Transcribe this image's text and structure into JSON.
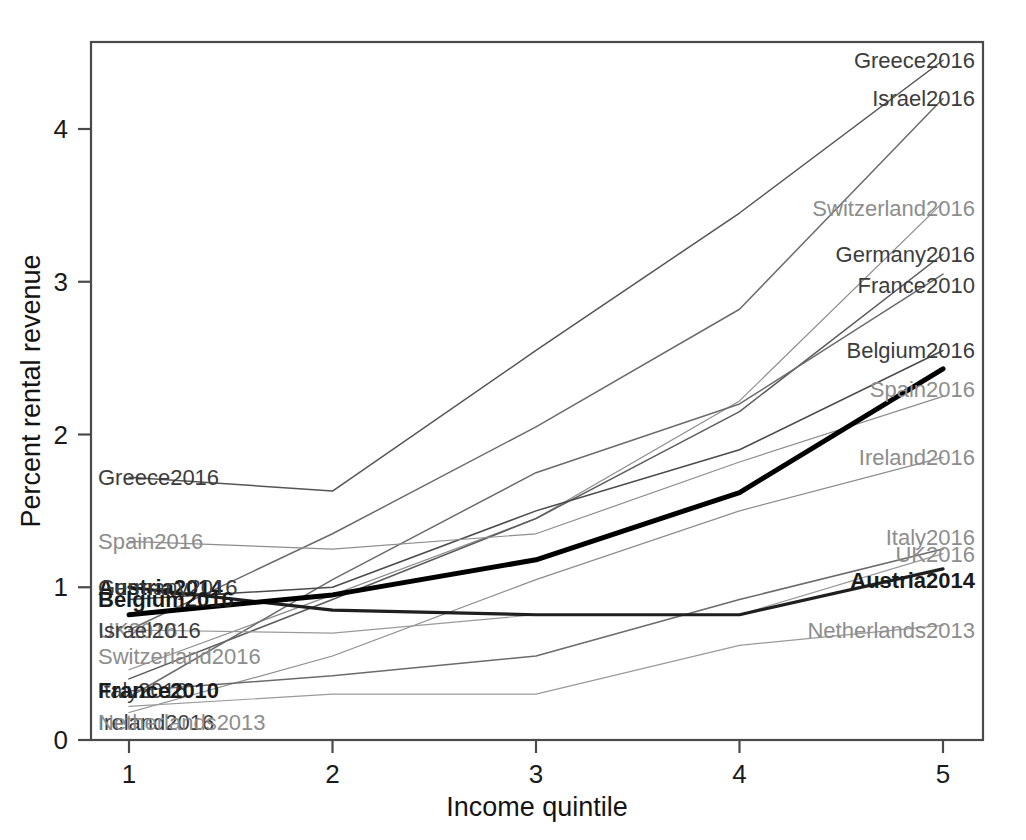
{
  "chart_data": {
    "type": "line",
    "title": "",
    "xlabel": "Income quintile",
    "ylabel": "Percent rental revenue",
    "x": [
      1,
      2,
      3,
      4,
      5
    ],
    "xticklabels": [
      "1",
      "2",
      "3",
      "4",
      "5"
    ],
    "yticklabels": [
      "0",
      "1",
      "2",
      "3",
      "4"
    ],
    "yticks": [
      0,
      1,
      2,
      3,
      4
    ],
    "xlim": [
      0.8,
      5.2
    ],
    "ylim": [
      0,
      4.65
    ],
    "grid": false,
    "legend": "inline-endpoint-labels",
    "series": [
      {
        "name": "Greece2016",
        "values": [
          1.72,
          1.63,
          2.55,
          3.45,
          4.45
        ],
        "emphasis": "normal",
        "color": "#555555"
      },
      {
        "name": "Israel2016",
        "values": [
          0.72,
          1.35,
          2.05,
          2.82,
          4.2
        ],
        "emphasis": "normal",
        "color": "#6b6b6b"
      },
      {
        "name": "Switzerland2016",
        "values": [
          0.46,
          0.95,
          1.45,
          2.22,
          3.52
        ],
        "emphasis": "light",
        "color": "#8d8d8d"
      },
      {
        "name": "Germany2016",
        "values": [
          0.4,
          0.92,
          1.45,
          2.15,
          3.18
        ],
        "emphasis": "normal",
        "color": "#5c5c5c"
      },
      {
        "name": "France2010",
        "values": [
          0.28,
          1.05,
          1.75,
          2.2,
          3.05
        ],
        "emphasis": "normal",
        "color": "#6b6b6b"
      },
      {
        "name": "Belgium2016",
        "values": [
          0.92,
          1.0,
          1.5,
          1.9,
          2.55
        ],
        "emphasis": "normal",
        "color": "#4a4a4a"
      },
      {
        "name": "Spain2016",
        "values": [
          1.3,
          1.25,
          1.35,
          1.82,
          2.25
        ],
        "emphasis": "light",
        "color": "#8d8d8d"
      },
      {
        "name": "Ireland2016",
        "values": [
          0.18,
          0.55,
          1.05,
          1.5,
          1.85
        ],
        "emphasis": "light",
        "color": "#8d8d8d"
      },
      {
        "name": "Italy2016",
        "values": [
          0.32,
          0.42,
          0.55,
          0.92,
          1.25
        ],
        "emphasis": "normal",
        "color": "#6b6b6b"
      },
      {
        "name": "UK2016",
        "values": [
          0.72,
          0.7,
          0.82,
          0.82,
          1.22
        ],
        "emphasis": "light",
        "color": "#9a9a9a"
      },
      {
        "name": "Austria2014",
        "values": [
          1.0,
          0.85,
          0.82,
          0.82,
          1.12
        ],
        "emphasis": "bold",
        "color": "#1f1f1f"
      },
      {
        "name": "Netherlands2013",
        "values": [
          0.22,
          0.3,
          0.3,
          0.62,
          0.75
        ],
        "emphasis": "light",
        "color": "#9a9a9a"
      },
      {
        "name": "Average",
        "values": [
          0.82,
          0.95,
          1.18,
          1.62,
          2.43
        ],
        "emphasis": "heavy",
        "color": "#000000"
      }
    ],
    "left_labels": [
      {
        "text": "Greece2016",
        "value": 1.72,
        "tone": "mid"
      },
      {
        "text": "Spain2016",
        "value": 1.3,
        "tone": "light"
      },
      {
        "text": "Austria2014",
        "value": 1.0,
        "tone": "dark"
      },
      {
        "text": "Germany2016",
        "value": 1.0,
        "tone": "mid"
      },
      {
        "text": "Belgium2016",
        "value": 0.92,
        "tone": "dark"
      },
      {
        "text": "UK2016",
        "value": 0.72,
        "tone": "light"
      },
      {
        "text": "Israel2016",
        "value": 0.72,
        "tone": "mid"
      },
      {
        "text": "Switzerland2016",
        "value": 0.55,
        "tone": "light"
      },
      {
        "text": "Italy2016",
        "value": 0.33,
        "tone": "mid"
      },
      {
        "text": "France2010",
        "value": 0.33,
        "tone": "dark"
      },
      {
        "text": "Ireland2016",
        "value": 0.12,
        "tone": "mid"
      },
      {
        "text": "Netherlands2013",
        "value": 0.12,
        "tone": "light"
      }
    ],
    "right_labels": [
      {
        "text": "Greece2016",
        "value": 4.45,
        "tone": "mid"
      },
      {
        "text": "Israel2016",
        "value": 4.2,
        "tone": "mid"
      },
      {
        "text": "Switzerland2016",
        "value": 3.48,
        "tone": "light"
      },
      {
        "text": "Germany2016",
        "value": 3.18,
        "tone": "mid"
      },
      {
        "text": "France2010",
        "value": 2.98,
        "tone": "mid"
      },
      {
        "text": "Belgium2016",
        "value": 2.55,
        "tone": "mid"
      },
      {
        "text": "Spain2016",
        "value": 2.3,
        "tone": "light"
      },
      {
        "text": "Ireland2016",
        "value": 1.85,
        "tone": "light"
      },
      {
        "text": "Italy2016",
        "value": 1.33,
        "tone": "light"
      },
      {
        "text": "UK2016",
        "value": 1.22,
        "tone": "light"
      },
      {
        "text": "Austria2014",
        "value": 1.05,
        "tone": "dark"
      },
      {
        "text": "Netherlands2013",
        "value": 0.72,
        "tone": "light"
      }
    ]
  },
  "axes": {
    "xlabel": "Income quintile",
    "ylabel": "Percent rental revenue"
  }
}
